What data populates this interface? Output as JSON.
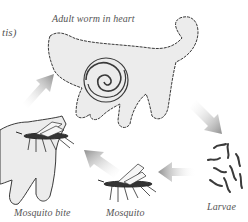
{
  "diagram": {
    "title_fragment": "tis)",
    "labels": {
      "adult_worm": "Adult worm in heart",
      "larvae": "Larvae",
      "mosquito": "Mosquito",
      "mosquito_bite": "Mosquito bite"
    },
    "nodes": [
      {
        "id": "cat-adult",
        "icon": "cat-with-heart-worm-icon",
        "label_key": "adult_worm"
      },
      {
        "id": "larvae",
        "icon": "larvae-icon",
        "label_key": "larvae"
      },
      {
        "id": "mosquito",
        "icon": "mosquito-icon",
        "label_key": "mosquito"
      },
      {
        "id": "cat-bite",
        "icon": "cat-mosquito-bite-icon",
        "label_key": "mosquito_bite"
      }
    ],
    "edges": [
      {
        "from": "cat-adult",
        "to": "larvae",
        "icon": "arrow-down-right-icon"
      },
      {
        "from": "larvae",
        "to": "mosquito",
        "icon": "arrow-left-icon"
      },
      {
        "from": "mosquito",
        "to": "cat-bite",
        "icon": "arrow-up-left-icon"
      },
      {
        "from": "cat-bite",
        "to": "cat-adult",
        "icon": "arrow-up-right-icon"
      }
    ],
    "colors": {
      "background": "#ffffff",
      "cat_fill": "#ececec",
      "outline": "#3a3a3a",
      "arrow": "#9a9a9a",
      "label_text": "#555555"
    }
  }
}
